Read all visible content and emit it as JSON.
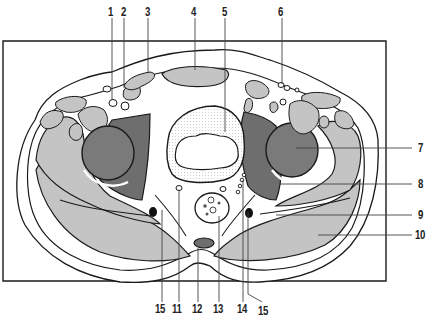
{
  "diagram": {
    "type": "anatomical cross-section (pelvis, axial view)",
    "colors": {
      "outline": "#1a1a1a",
      "light_muscle": "#c4c4c4",
      "dark_muscle": "#6e6e6e",
      "femoral_head": "#7a7a7a",
      "bladder_wall": "#e6e6e6",
      "background": "#ffffff"
    },
    "labels": [
      {
        "id": "1",
        "text": "1",
        "x": 108,
        "y": 6
      },
      {
        "id": "2",
        "text": "2",
        "x": 121,
        "y": 6
      },
      {
        "id": "3",
        "text": "3",
        "x": 145,
        "y": 6
      },
      {
        "id": "4",
        "text": "4",
        "x": 191,
        "y": 6
      },
      {
        "id": "5",
        "text": "5",
        "x": 222,
        "y": 6
      },
      {
        "id": "6",
        "text": "6",
        "x": 278,
        "y": 6
      },
      {
        "id": "7",
        "text": "7",
        "x": 418,
        "y": 143
      },
      {
        "id": "8",
        "text": "8",
        "x": 418,
        "y": 177
      },
      {
        "id": "9",
        "text": "9",
        "x": 418,
        "y": 208
      },
      {
        "id": "10",
        "text": "10",
        "x": 416,
        "y": 233
      },
      {
        "id": "15a",
        "text": "15",
        "x": 157,
        "y": 305
      },
      {
        "id": "11",
        "text": "11",
        "x": 174,
        "y": 305
      },
      {
        "id": "12",
        "text": "12",
        "x": 193,
        "y": 305
      },
      {
        "id": "13",
        "text": "13",
        "x": 218,
        "y": 305
      },
      {
        "id": "14",
        "text": "14",
        "x": 240,
        "y": 305
      },
      {
        "id": "15b",
        "text": "15",
        "x": 264,
        "y": 305
      }
    ]
  }
}
